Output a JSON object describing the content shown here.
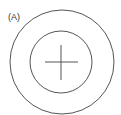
{
  "figure": {
    "panel_label": "(A)",
    "stroke_color": "#555555",
    "background": "#ffffff",
    "outer_circle": {
      "cx": 62,
      "cy": 62,
      "r": 52
    },
    "inner_circle": {
      "cx": 61,
      "cy": 62,
      "r": 31
    },
    "crosshair": {
      "horizontal": {
        "x1": 45,
        "y1": 62,
        "x2": 78,
        "y2": 62
      },
      "vertical": {
        "x1": 61,
        "y1": 45,
        "x2": 61,
        "y2": 80
      }
    }
  }
}
